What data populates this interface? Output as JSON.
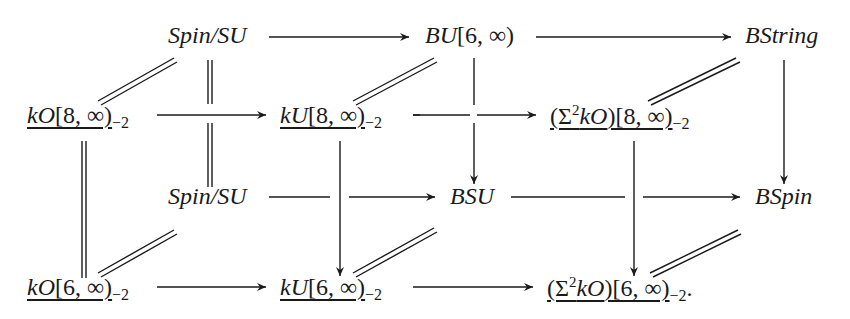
{
  "diagram": {
    "type": "commutative-cube",
    "nodes": {
      "back_top_left": {
        "main": "Spin/SU",
        "italic": true,
        "underlined": false,
        "sub": "",
        "sup": ""
      },
      "back_top_mid": {
        "italic_part": "BU",
        "roman_part": "[6, ∞)"
      },
      "back_top_right": {
        "main": "BString"
      },
      "front_top_left": {
        "italic_part": "kO",
        "roman_part": "[8, ∞)",
        "sub": "−2"
      },
      "front_top_mid": {
        "italic_part": "kU",
        "roman_part": "[8, ∞)",
        "sub": "−2"
      },
      "front_top_right": {
        "pre": "(Σ",
        "sup": "2",
        "italic_part": "kO",
        "roman_part": ")[8, ∞)",
        "sub": "−2"
      },
      "back_bot_left": {
        "main": "Spin/SU"
      },
      "back_bot_mid": {
        "main": "BSU"
      },
      "back_bot_right": {
        "main": "BSpin"
      },
      "front_bot_left": {
        "italic_part": "kO",
        "roman_part": "[6, ∞)",
        "sub": "−2"
      },
      "front_bot_mid": {
        "italic_part": "kU",
        "roman_part": "[6, ∞)",
        "sub": "−2"
      },
      "front_bot_right": {
        "pre": "(Σ",
        "sup": "2",
        "italic_part": "kO",
        "roman_part": ")[6, ∞)",
        "sub": "−2",
        "trailing": "."
      }
    },
    "edges": [
      {
        "from": "back_top_left",
        "to": "back_top_mid",
        "kind": "arrow"
      },
      {
        "from": "back_top_mid",
        "to": "back_top_right",
        "kind": "arrow"
      },
      {
        "from": "front_top_left",
        "to": "front_top_mid",
        "kind": "arrow"
      },
      {
        "from": "front_top_mid",
        "to": "front_top_right",
        "kind": "arrow"
      },
      {
        "from": "back_bot_left",
        "to": "back_bot_mid",
        "kind": "arrow"
      },
      {
        "from": "back_bot_mid",
        "to": "back_bot_right",
        "kind": "arrow"
      },
      {
        "from": "front_bot_left",
        "to": "front_bot_mid",
        "kind": "arrow"
      },
      {
        "from": "front_bot_mid",
        "to": "front_bot_right",
        "kind": "arrow"
      },
      {
        "from": "back_top_left",
        "to": "back_bot_left",
        "kind": "equality"
      },
      {
        "from": "back_top_mid",
        "to": "back_bot_mid",
        "kind": "arrow"
      },
      {
        "from": "back_top_right",
        "to": "back_bot_right",
        "kind": "arrow"
      },
      {
        "from": "front_top_left",
        "to": "front_bot_left",
        "kind": "equality"
      },
      {
        "from": "front_top_mid",
        "to": "front_bot_mid",
        "kind": "arrow"
      },
      {
        "from": "front_top_right",
        "to": "front_bot_right",
        "kind": "arrow"
      },
      {
        "from": "front_top_left",
        "to": "back_top_left",
        "kind": "equality"
      },
      {
        "from": "front_top_mid",
        "to": "back_top_mid",
        "kind": "equality"
      },
      {
        "from": "front_top_right",
        "to": "back_top_right",
        "kind": "equality"
      },
      {
        "from": "front_bot_left",
        "to": "back_bot_left",
        "kind": "equality"
      },
      {
        "from": "front_bot_mid",
        "to": "back_bot_mid",
        "kind": "equality"
      },
      {
        "from": "front_bot_right",
        "to": "back_bot_right",
        "kind": "equality"
      }
    ]
  }
}
